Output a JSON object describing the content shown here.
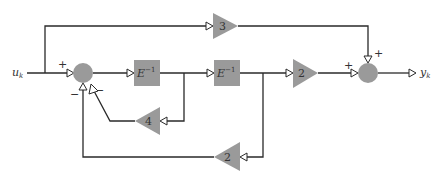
{
  "diagram": {
    "type": "block-diagram",
    "input": {
      "label": "u",
      "subscript": "k"
    },
    "output": {
      "label": "y",
      "subscript": "k"
    },
    "delays": [
      {
        "id": "delay1",
        "label": "E",
        "superscript": "−1"
      },
      {
        "id": "delay2",
        "label": "E",
        "superscript": "−1"
      }
    ],
    "gains": [
      {
        "id": "gain_feedforward",
        "value": "3"
      },
      {
        "id": "gain_output",
        "value": "2"
      },
      {
        "id": "gain_feedback_inner",
        "value": "4"
      },
      {
        "id": "gain_feedback_outer",
        "value": "2"
      }
    ],
    "sums": [
      {
        "id": "sum1",
        "signs": {
          "input": "+",
          "inner_feedback": "−",
          "outer_feedback": "−"
        }
      },
      {
        "id": "sum2",
        "signs": {
          "forward": "+",
          "feedforward": "+"
        }
      }
    ],
    "colors": {
      "block": "#9a9a9a",
      "wire": "#2a2a2a",
      "background": "#ffffff"
    }
  }
}
